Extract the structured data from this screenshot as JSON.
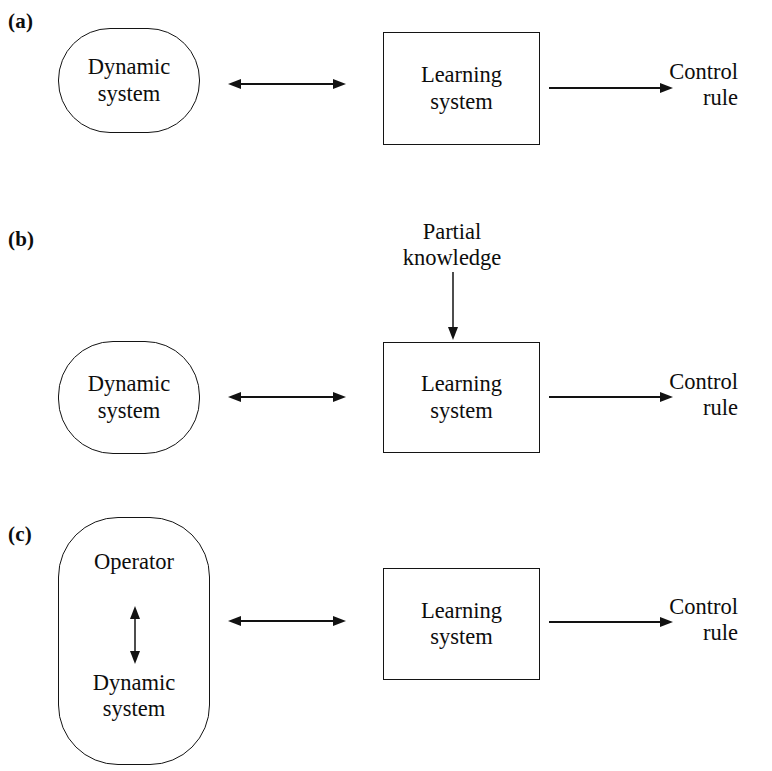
{
  "figure": {
    "width": 772,
    "height": 771,
    "background": "#ffffff",
    "ink_color": "#121212"
  },
  "panels": [
    {
      "id": "a",
      "label": "(a)",
      "nodes": {
        "plant": {
          "shape": "stadium",
          "lines": [
            "Dynamic",
            "system"
          ]
        },
        "learner": {
          "shape": "rectangle",
          "lines": [
            "Learning",
            "system"
          ]
        }
      },
      "outputs": {
        "control_rule": [
          "Control",
          "rule"
        ]
      },
      "connectors": [
        {
          "name": "plant-learner-bidirectional",
          "type": "double-arrow",
          "orientation": "horizontal"
        },
        {
          "name": "learner-output",
          "type": "single-arrow",
          "orientation": "horizontal"
        }
      ]
    },
    {
      "id": "b",
      "label": "(b)",
      "nodes": {
        "plant": {
          "shape": "stadium",
          "lines": [
            "Dynamic",
            "system"
          ]
        },
        "learner": {
          "shape": "rectangle",
          "lines": [
            "Learning",
            "system"
          ]
        }
      },
      "inputs": {
        "prior_knowledge": [
          "Partial",
          "knowledge"
        ]
      },
      "outputs": {
        "control_rule": [
          "Control",
          "rule"
        ]
      },
      "connectors": [
        {
          "name": "knowledge-into-learner",
          "type": "single-arrow",
          "orientation": "vertical-down"
        },
        {
          "name": "plant-learner-bidirectional",
          "type": "double-arrow",
          "orientation": "horizontal"
        },
        {
          "name": "learner-output",
          "type": "single-arrow",
          "orientation": "horizontal"
        }
      ]
    },
    {
      "id": "c",
      "label": "(c)",
      "nodes": {
        "human_plant": {
          "shape": "stadium-tall",
          "top_lines": [
            "Operator"
          ],
          "bottom_lines": [
            "Dynamic",
            "system"
          ],
          "internal_link": "double-arrow-vertical"
        },
        "learner": {
          "shape": "rectangle",
          "lines": [
            "Learning",
            "system"
          ]
        }
      },
      "outputs": {
        "control_rule": [
          "Control",
          "rule"
        ]
      },
      "connectors": [
        {
          "name": "operator-plant-bidirectional",
          "type": "double-arrow",
          "orientation": "vertical"
        },
        {
          "name": "plant-learner-bidirectional",
          "type": "double-arrow",
          "orientation": "horizontal"
        },
        {
          "name": "learner-output",
          "type": "single-arrow",
          "orientation": "horizontal"
        }
      ]
    }
  ]
}
